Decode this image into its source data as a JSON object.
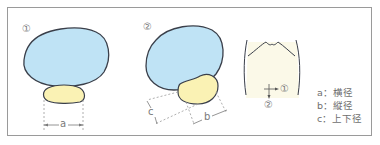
{
  "figure": {
    "panels": [
      {
        "id": "panel-1",
        "marker": "①",
        "measure_label": "a"
      },
      {
        "id": "panel-2",
        "marker": "②",
        "measure_labels": [
          "c",
          "b"
        ]
      }
    ],
    "body_view": {
      "direction_markers": [
        "①",
        "②"
      ]
    },
    "legend": [
      {
        "key": "a",
        "sep": "：",
        "text": "横径"
      },
      {
        "key": "b",
        "sep": "：",
        "text": "縦径"
      },
      {
        "key": "c",
        "sep": "：",
        "text": "上下径"
      }
    ],
    "colors": {
      "bladder_fill": "#bfe3f5",
      "prostate_fill": "#faf2b4",
      "outline": "#3a3f4a",
      "body_fill": "#fbf9e8",
      "frame": "#9a9a9a",
      "dashed": "#9a9a9a"
    }
  }
}
